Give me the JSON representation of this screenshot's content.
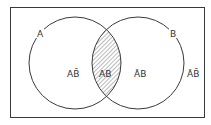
{
  "diagram": {
    "type": "venn",
    "sets": [
      {
        "name": "A",
        "label": "A"
      },
      {
        "name": "B",
        "label": "B"
      }
    ],
    "regions": [
      {
        "id": "a-not-b",
        "label": "AB̄",
        "shaded": false
      },
      {
        "id": "a-and-b",
        "label": "AB",
        "shaded": true
      },
      {
        "id": "not-a-b",
        "label": "ĀB",
        "shaded": false
      },
      {
        "id": "not-a-not-b",
        "label": "ĀB̄",
        "shaded": false
      }
    ],
    "colors": {
      "stroke": "#3a3a3a",
      "hatch": "#555555",
      "background": "#ffffff"
    }
  }
}
